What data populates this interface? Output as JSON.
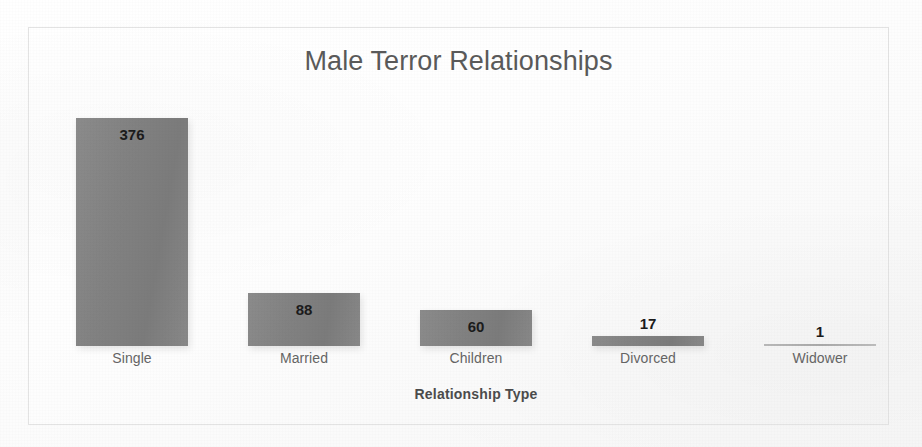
{
  "chart_data": {
    "type": "bar",
    "title": "Male Terror Relationships",
    "xlabel": "Relationship Type",
    "ylabel": "# Terrorists",
    "categories": [
      "Single",
      "Married",
      "Children",
      "Divorced",
      "Widower"
    ],
    "values": [
      376,
      88,
      60,
      17,
      1
    ],
    "value_labels": [
      "376",
      "88",
      "60",
      "17",
      "1"
    ],
    "ylim": [
      0,
      425
    ],
    "grid": false,
    "legend": false,
    "legend_position": "none",
    "series": [
      {
        "name": "# Terrorists",
        "values": [
          376,
          88,
          60,
          17,
          1
        ]
      }
    ],
    "colors": {
      "bar": "#828282",
      "title_text": "#5a5a5a",
      "axis_title_text": "#4c4c4c",
      "tick_text": "#656565",
      "data_label_text": "#1b1b1b",
      "plot_background": "#fbfbfb",
      "frame_border": "#e3e3e3"
    },
    "bars": [
      {
        "category": "Single",
        "value": 376,
        "label": "376",
        "label_placement": "inside"
      },
      {
        "category": "Married",
        "value": 88,
        "label": "88",
        "label_placement": "inside"
      },
      {
        "category": "Children",
        "value": 60,
        "label": "60",
        "label_placement": "inside"
      },
      {
        "category": "Divorced",
        "value": 17,
        "label": "17",
        "label_placement": "above"
      },
      {
        "category": "Widower",
        "value": 1,
        "label": "1",
        "label_placement": "above"
      }
    ]
  }
}
